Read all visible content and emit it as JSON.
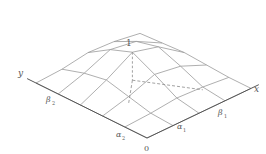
{
  "figure": {
    "type": "3d-surface-wireframe",
    "labels": {
      "x_axis": "x",
      "y_axis": "y",
      "origin": "0",
      "alpha1": "α",
      "alpha1_sub": "1",
      "beta1": "β",
      "beta1_sub": "1",
      "alpha2": "α",
      "alpha2_sub": "2",
      "beta2": "β",
      "beta2_sub": "2",
      "peak": "1"
    },
    "colors": {
      "grid": "#9a9a9a",
      "axis": "#555555",
      "dashed": "#8a8a8a",
      "text": "#555555"
    },
    "projection": {
      "origin": [
        147,
        138
      ],
      "ex": [
        26,
        -12.4
      ],
      "ey": [
        -22.2,
        -11
      ],
      "ez": [
        0,
        -28
      ]
    },
    "grid": {
      "nx": 4,
      "ny": 5,
      "heights": [
        [
          0,
          0,
          0,
          0,
          0,
          0
        ],
        [
          0,
          0.05,
          0.25,
          0.45,
          0.3,
          0.05
        ],
        [
          0,
          0.15,
          0.6,
          1.0,
          0.7,
          0.2
        ],
        [
          0,
          0.1,
          0.45,
          0.75,
          0.55,
          0.15
        ],
        [
          0,
          0,
          0.05,
          0.1,
          0.05,
          0
        ]
      ]
    },
    "peak_node": [
      2,
      3
    ],
    "axis_extent": {
      "x": 4.3,
      "y": 5.4
    }
  }
}
